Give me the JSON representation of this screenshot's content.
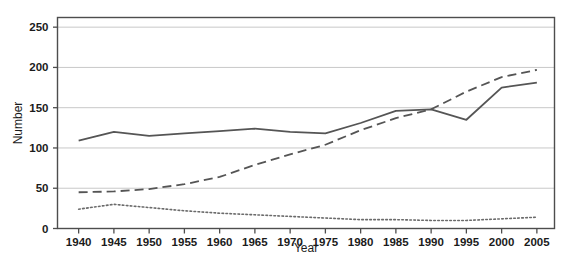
{
  "chart_data": {
    "type": "line",
    "title": "",
    "xlabel": "Year",
    "ylabel": "Number",
    "x": [
      1940,
      1945,
      1950,
      1955,
      1960,
      1965,
      1970,
      1975,
      1980,
      1985,
      1990,
      1995,
      2000,
      2005
    ],
    "xtick_labels": [
      "1940",
      "1945",
      "1950",
      "1955",
      "1960",
      "1965",
      "1970",
      "1975",
      "1980",
      "1985",
      "1990",
      "1995",
      "2000",
      "2005"
    ],
    "ytick_labels": [
      "0",
      "50",
      "100",
      "150",
      "200",
      "250"
    ],
    "yticks": [
      0,
      50,
      100,
      150,
      200,
      250
    ],
    "xlim": [
      1937,
      2007.5
    ],
    "ylim": [
      0,
      262
    ],
    "grid": "horizontal",
    "legend": "none",
    "series": [
      {
        "name": "solid-series",
        "style": "solid",
        "color": "#555555",
        "values": [
          109,
          120,
          115,
          118,
          121,
          124,
          120,
          118,
          131,
          146,
          148,
          135,
          175,
          181
        ]
      },
      {
        "name": "dashed-series",
        "style": "dashed",
        "color": "#555555",
        "values": [
          45,
          46,
          49,
          55,
          64,
          79,
          92,
          104,
          122,
          137,
          148,
          170,
          188,
          197
        ]
      },
      {
        "name": "dotted-series",
        "style": "dotted",
        "color": "#6b6b6b",
        "values": [
          24,
          30,
          26,
          22,
          19,
          17,
          15,
          13,
          11,
          11,
          10,
          10,
          12,
          14
        ]
      }
    ]
  },
  "figure": {
    "background_color": "#ffffff",
    "frame_color": "#4d4d4d",
    "gridline_color": "#c8c8c8",
    "text_color": "#1b1b1b"
  }
}
